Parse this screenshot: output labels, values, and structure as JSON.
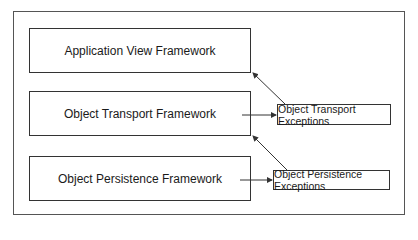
{
  "diagram": {
    "frameworks": [
      {
        "label": "Application View Framework"
      },
      {
        "label": "Object Transport Framework"
      },
      {
        "label": "Object Persistence Framework"
      }
    ],
    "exceptions": [
      {
        "label": "Object Transport Exceptions"
      },
      {
        "label": "Object Persistence Exceptions"
      }
    ],
    "edges": [
      {
        "from": "Object Transport Framework",
        "to": "Object Transport Exceptions"
      },
      {
        "from": "Object Transport Exceptions",
        "to": "Application View Framework"
      },
      {
        "from": "Object Persistence Framework",
        "to": "Object Persistence Exceptions"
      },
      {
        "from": "Object Persistence Exceptions",
        "to": "Object Transport Framework"
      }
    ],
    "colors": {
      "stroke": "#333333",
      "background": "#ffffff"
    }
  }
}
